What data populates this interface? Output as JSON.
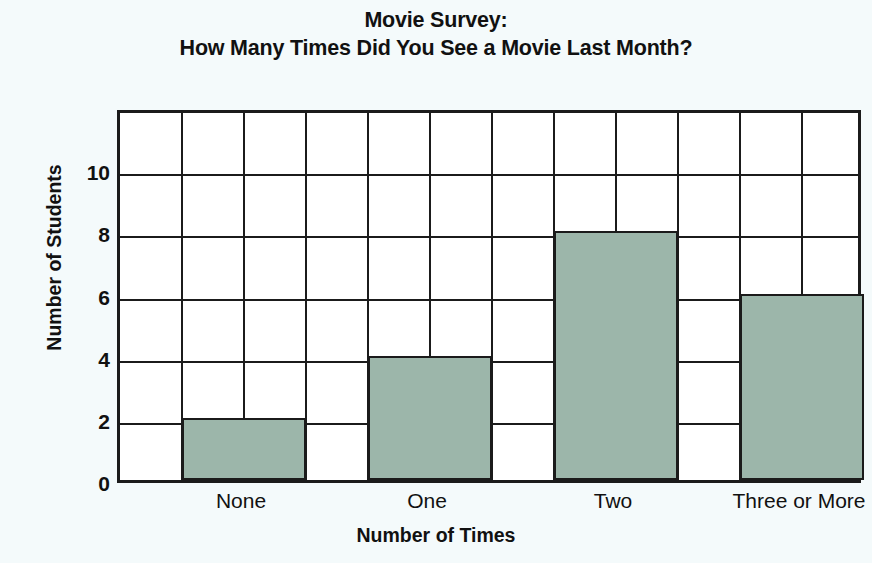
{
  "chart_data": {
    "type": "bar",
    "title": "Movie Survey: How Many Times Did You See a Movie Last Month?",
    "title_lines": [
      "Movie Survey:",
      "How Many Times Did You See a Movie Last Month?"
    ],
    "categories": [
      "None",
      "One",
      "Two",
      "Three or More"
    ],
    "values": [
      2,
      4,
      8,
      6
    ],
    "xlabel": "Number of Times",
    "ylabel": "Number of Students",
    "ylim": [
      0,
      12
    ],
    "ytick_labels": [
      "0",
      "2",
      "4",
      "6",
      "8",
      "10"
    ],
    "ytick_values": [
      0,
      2,
      4,
      6,
      8,
      10
    ],
    "ygrid_values": [
      0,
      2,
      4,
      6,
      8,
      10,
      12
    ],
    "grid": true,
    "grid_columns": 12,
    "grid_rows": 6,
    "legend": null,
    "colors": {
      "bar_fill": "#9cb6aa",
      "axis_line": "#1b1b1b",
      "grid_line": "#1b1b1b",
      "plot_background": "#ffffff",
      "page_background": "#f4fafb",
      "text": "#111111"
    }
  }
}
